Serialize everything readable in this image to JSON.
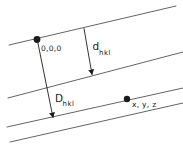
{
  "diagram": {
    "background_color": "#ffffff",
    "plane_line_color": "#3c3c3c",
    "ink_color": "#1c1c1c",
    "lattice_lines": [
      {
        "x1": 9,
        "y1": 45,
        "x2": 176,
        "y2": 6
      },
      {
        "x1": 8,
        "y1": 98,
        "x2": 183,
        "y2": 52
      },
      {
        "x1": 7,
        "y1": 127,
        "x2": 183,
        "y2": 88
      },
      {
        "x1": 10,
        "y1": 142,
        "x2": 183,
        "y2": 103
      }
    ],
    "points": [
      {
        "id": "origin",
        "label": "0,0,0",
        "cx": 37,
        "cy": 39.5,
        "r": 3.4
      },
      {
        "id": "xyz",
        "label": "x, y, z",
        "cx": 127,
        "cy": 99,
        "r": 3.2
      }
    ],
    "dimensions": [
      {
        "id": "d-spacing",
        "symbol": "d",
        "subscript": "hkl",
        "x1": 84,
        "y1": 28.5,
        "x2": 92,
        "y2": 74.5
      },
      {
        "id": "D-distance",
        "symbol": "D",
        "subscript": "hkl",
        "x1": 37.5,
        "y1": 41,
        "x2": 53,
        "y2": 117.5
      }
    ]
  }
}
